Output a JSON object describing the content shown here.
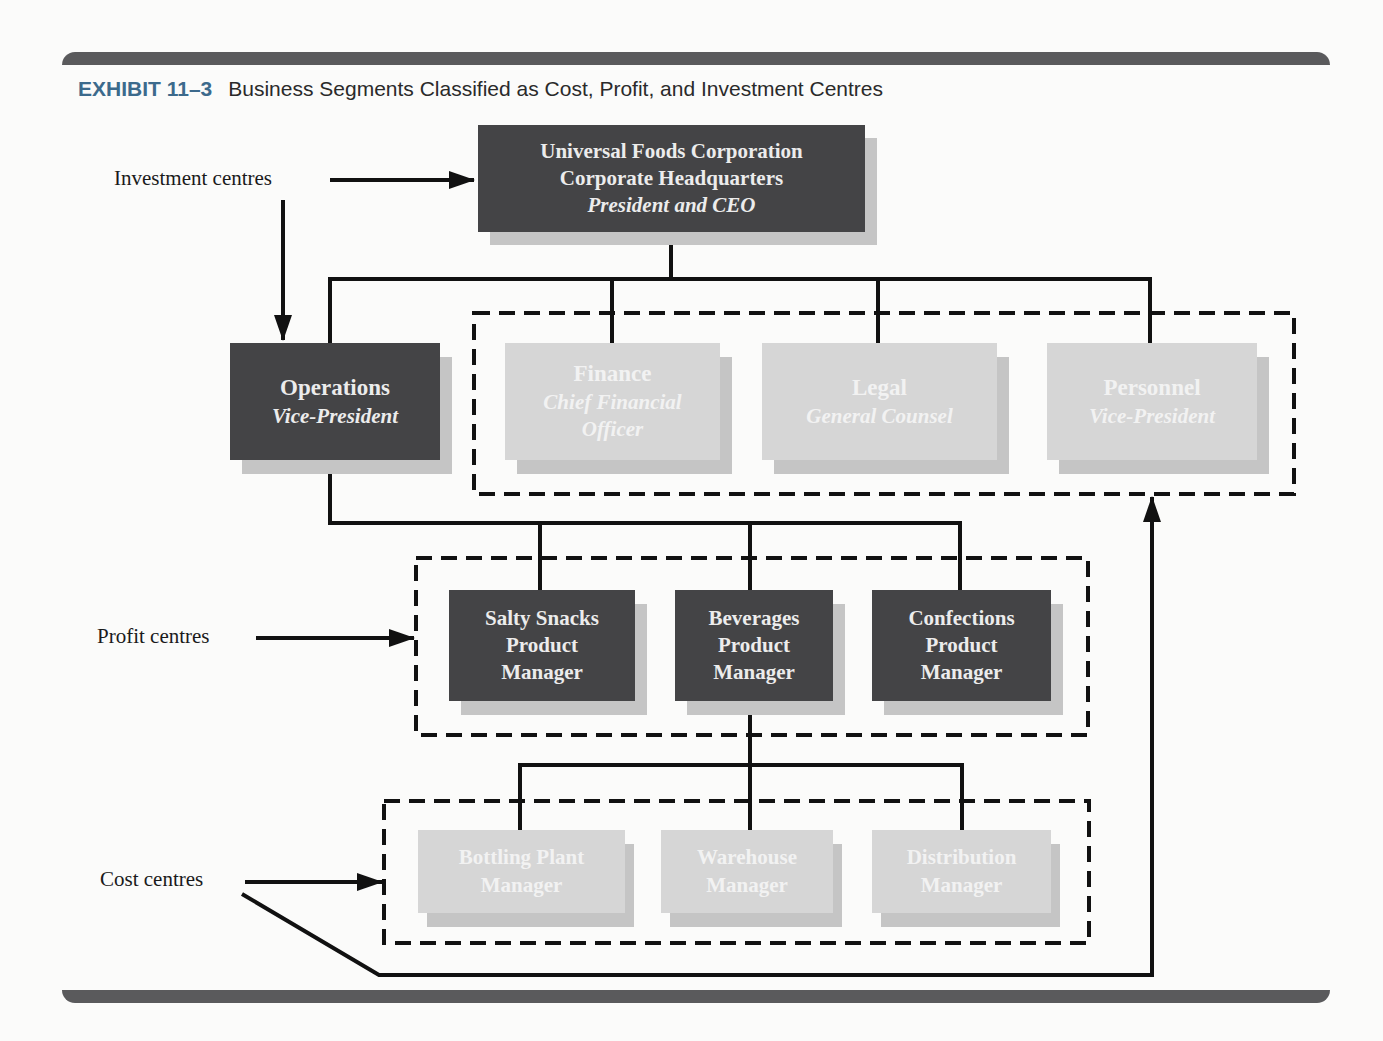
{
  "exhibit": {
    "number": "EXHIBIT 11–3",
    "title": "Business Segments Classified as Cost, Profit, and Investment Centres"
  },
  "labels": {
    "investment": "Investment centres",
    "profit": "Profit centres",
    "cost": "Cost centres"
  },
  "colors": {
    "dark_box": "#444446",
    "light_box": "#d6d6d6",
    "shadow": "#c5c5c5",
    "exhibit_number": "#3c6a8c",
    "frame_bar": "#5a5a5c"
  },
  "nodes": {
    "hq": {
      "line1": "Universal Foods Corporation",
      "line2": "Corporate Headquarters",
      "role": "President and CEO",
      "category": "investment"
    },
    "operations": {
      "name": "Operations",
      "role": "Vice-President",
      "category": "investment"
    },
    "finance": {
      "name": "Finance",
      "role_line1": "Chief Financial",
      "role_line2": "Officer",
      "category": "cost"
    },
    "legal": {
      "name": "Legal",
      "role": "General Counsel",
      "category": "cost"
    },
    "personnel": {
      "name": "Personnel",
      "role": "Vice-President",
      "category": "cost"
    },
    "salty_snacks": {
      "line1": "Salty Snacks",
      "line2": "Product",
      "line3": "Manager",
      "category": "profit"
    },
    "beverages": {
      "line1": "Beverages",
      "line2": "Product",
      "line3": "Manager",
      "category": "profit"
    },
    "confections": {
      "line1": "Confections",
      "line2": "Product",
      "line3": "Manager",
      "category": "profit"
    },
    "bottling": {
      "line1": "Bottling Plant",
      "line2": "Manager",
      "category": "cost"
    },
    "warehouse": {
      "line1": "Warehouse",
      "line2": "Manager",
      "category": "cost"
    },
    "distribution": {
      "line1": "Distribution",
      "line2": "Manager",
      "category": "cost"
    }
  }
}
